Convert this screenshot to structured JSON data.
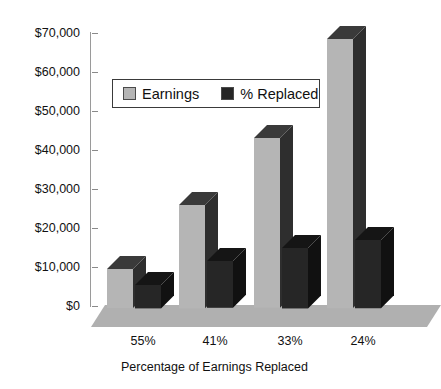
{
  "chart_data": {
    "type": "bar",
    "title": "",
    "xlabel": "Percentage of Earnings Replaced",
    "ylabel": "",
    "categories": [
      "55%",
      "41%",
      "33%",
      "24%"
    ],
    "ytick_labels": [
      "$0",
      "$10,000",
      "$20,000",
      "$30,000",
      "$40,000",
      "$50,000",
      "$60,000",
      "$70,000"
    ],
    "ytick_values": [
      0,
      10000,
      20000,
      30000,
      40000,
      50000,
      60000,
      70000
    ],
    "ylim": [
      0,
      70000
    ],
    "grid": false,
    "legend_position": "upper-left-inside",
    "style": "3d-column",
    "series": [
      {
        "name": "Earnings",
        "color": "#b5b5b5",
        "values": [
          10000,
          26500,
          43500,
          69000
        ]
      },
      {
        "name": "% Replaced",
        "color": "#262626",
        "values": [
          6000,
          12000,
          15500,
          17500
        ]
      }
    ]
  },
  "legend": {
    "items": [
      {
        "label": "Earnings",
        "color": "#b5b5b5"
      },
      {
        "label": "% Replaced",
        "color": "#262626"
      }
    ]
  },
  "axes": {
    "x_title": "Percentage of Earnings Replaced"
  },
  "colors": {
    "earnings_front": "#b5b5b5",
    "earnings_top": "#3a3a3a",
    "earnings_side": "#2e2e2e",
    "replaced_front": "#262626",
    "replaced_top": "#151515",
    "replaced_side": "#111111",
    "floor": "#b0b0b0",
    "axis": "#9a9a9a",
    "text": "#111111",
    "background": "#ffffff"
  }
}
